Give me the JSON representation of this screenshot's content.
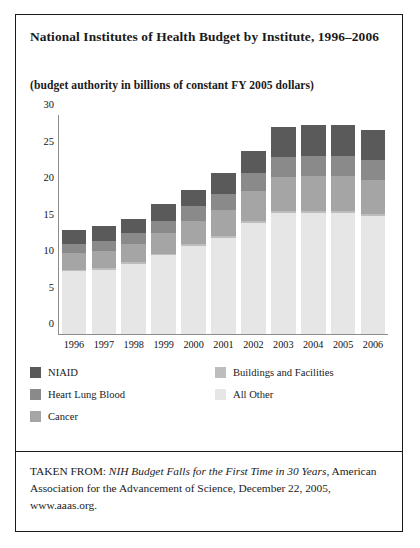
{
  "title": "National Institutes of Health Budget by Institute, 1996–2006",
  "subtitle": "(budget authority in billions of constant FY 2005 dollars)",
  "source": {
    "prefix": "TAKEN FROM: ",
    "italic": "NIH Budget Falls for the First Time in 30 Years",
    "rest": ", American Association for the Advancement of Science, December 22, 2005, www.aaas.org."
  },
  "legend": {
    "items": [
      {
        "label": "NIAID",
        "color": "#5a5a5a"
      },
      {
        "label": "Heart Lung Blood",
        "color": "#8a8a8a"
      },
      {
        "label": "Cancer",
        "color": "#a5a5a5"
      },
      {
        "label": "Buildings and Facilities",
        "color": "#bdbdbd"
      },
      {
        "label": "All Other",
        "color": "#e6e6e6"
      }
    ]
  },
  "chart_data": {
    "type": "bar",
    "title": "National Institutes of Health Budget by Institute, 1996–2006",
    "subtitle": "(budget authority in billions of constant FY 2005 dollars)",
    "xlabel": "",
    "ylabel": "",
    "ylim": [
      0,
      30
    ],
    "yticks": [
      0,
      5,
      10,
      15,
      20,
      25,
      30
    ],
    "grid": false,
    "stacked": true,
    "legend_position": "below-plot",
    "categories": [
      "1996",
      "1997",
      "1998",
      "1999",
      "2000",
      "2001",
      "2002",
      "2003",
      "2004",
      "2005",
      "2006"
    ],
    "series": [
      {
        "name": "All Other",
        "color": "#e6e6e6",
        "values": [
          8.6,
          8.8,
          9.6,
          10.8,
          12.0,
          13.1,
          15.2,
          16.6,
          16.6,
          16.6,
          16.2
        ]
      },
      {
        "name": "Buildings and Facilities",
        "color": "#bdbdbd",
        "values": [
          0.2,
          0.2,
          0.2,
          0.2,
          0.3,
          0.3,
          0.3,
          0.3,
          0.3,
          0.3,
          0.3
        ]
      },
      {
        "name": "Cancer",
        "color": "#a5a5a5",
        "values": [
          2.3,
          2.4,
          2.5,
          2.8,
          3.2,
          3.6,
          4.1,
          4.6,
          4.7,
          4.7,
          4.6
        ]
      },
      {
        "name": "Heart Lung Blood",
        "color": "#8a8a8a",
        "values": [
          1.3,
          1.4,
          1.5,
          1.7,
          2.0,
          2.2,
          2.5,
          2.8,
          2.8,
          2.8,
          2.8
        ]
      },
      {
        "name": "NIAID",
        "color": "#5a5a5a",
        "values": [
          1.8,
          2.0,
          2.0,
          2.3,
          2.3,
          2.9,
          3.0,
          4.0,
          4.2,
          4.2,
          4.1
        ]
      }
    ],
    "totals": [
      14.2,
      14.8,
      15.8,
      17.8,
      19.8,
      22.1,
      25.1,
      28.3,
      28.6,
      28.6,
      28.0
    ]
  }
}
